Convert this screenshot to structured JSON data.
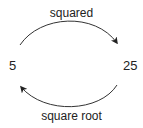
{
  "diagram": {
    "nodes": [
      {
        "id": "left",
        "label": "5"
      },
      {
        "id": "right",
        "label": "25"
      }
    ],
    "edges": [
      {
        "from": "left",
        "to": "right",
        "label": "squared",
        "position": "top"
      },
      {
        "from": "right",
        "to": "left",
        "label": "square root",
        "position": "bottom"
      }
    ],
    "colors": {
      "stroke": "#333333",
      "text": "#222222",
      "background": "#ffffff"
    }
  }
}
